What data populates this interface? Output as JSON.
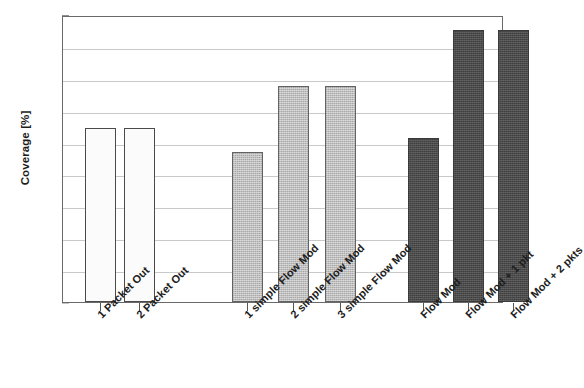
{
  "chart_data": {
    "type": "bar",
    "title": "",
    "xlabel": "",
    "ylabel": "Coverage [%]",
    "ylim": [
      0,
      45
    ],
    "ytick_values": [
      0,
      5,
      10,
      15,
      20,
      25,
      30,
      35,
      40,
      45
    ],
    "ytick_labels": [
      "0",
      "5",
      "10",
      "15",
      "20",
      "25",
      "30",
      "35",
      "40",
      "45"
    ],
    "grid": true,
    "legend": "none",
    "categories": [
      "1 Packet Out",
      "2 Packet Out",
      "1 simple Flow Mod",
      "2 simple Flow Mod",
      "3 simple Flow Mod",
      "Flow Mod",
      "Flow Mod + 1 pkt",
      "Flow Mod + 2 pkts"
    ],
    "values": [
      27.3,
      27.3,
      23.5,
      33.8,
      33.8,
      25.7,
      42.6,
      42.6
    ],
    "bar_styles": [
      "white",
      "white",
      "light",
      "light",
      "light",
      "dark",
      "dark",
      "dark"
    ],
    "groups": [
      {
        "name": "Packet Out",
        "fill": "white",
        "indices": [
          0,
          1
        ]
      },
      {
        "name": "simple Flow Mod",
        "fill": "light",
        "indices": [
          2,
          3,
          4
        ]
      },
      {
        "name": "Flow Mod",
        "fill": "dark",
        "indices": [
          5,
          6,
          7
        ]
      }
    ],
    "colors": {
      "bar_white_fill": "#fbfbfb",
      "bar_light_fill": "#b6b6b6",
      "bar_dark_fill": "#474747",
      "bar_outline": "#4a4a4a",
      "gridline": "#c9c9c9",
      "axis": "#6a6a6a",
      "text": "#1a1a1a",
      "background": "#ffffff"
    }
  }
}
